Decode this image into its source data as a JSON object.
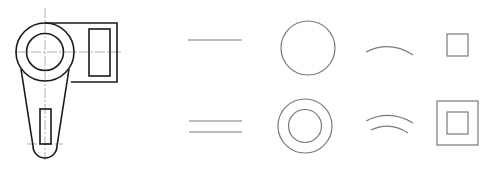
{
  "figure": {
    "colors": {
      "outline": "#1a1a1a",
      "primitive": "#7a7a7a",
      "centerline": "#999999",
      "background": "#ffffff"
    }
  },
  "part_drawing": {
    "name": "lever-part",
    "components": [
      "outer-boss-circle",
      "bore-circle",
      "side-block",
      "block-window",
      "tapered-arm",
      "slot",
      "centerlines"
    ]
  },
  "primitives": {
    "row_single": [
      "line",
      "circle",
      "arc",
      "square"
    ],
    "row_double": [
      "double-line",
      "concentric-circles",
      "double-arc",
      "nested-squares"
    ]
  }
}
